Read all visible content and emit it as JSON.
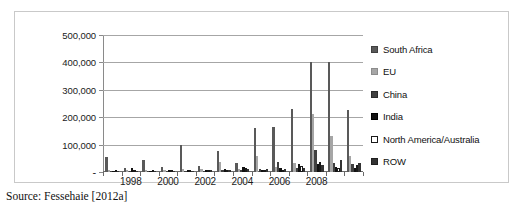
{
  "source_note": "Source: Fessehaie [2012a]",
  "legend": {
    "position": "right",
    "items": [
      {
        "label": "South Africa",
        "color": "#595959",
        "border": "#404040",
        "swatch": "filled-square"
      },
      {
        "label": "EU",
        "color": "#a6a6a6",
        "border": "#8c8c8c",
        "swatch": "filled-square"
      },
      {
        "label": "China",
        "color": "#404040",
        "border": "#2b2b2b",
        "swatch": "filled-square"
      },
      {
        "label": "India",
        "color": "#111111",
        "border": "#000000",
        "swatch": "filled-square"
      },
      {
        "label": "North America/Australia",
        "color": "#ffffff",
        "border": "#1a1a1a",
        "swatch": "hollow-square"
      },
      {
        "label": "ROW",
        "color": "#333333",
        "border": "#1f1f1f",
        "swatch": "filled-square"
      }
    ]
  },
  "chart_data": {
    "type": "bar",
    "title": "",
    "xlabel": "",
    "ylabel": "",
    "grid": true,
    "legend_position": "right",
    "ylim": [
      0,
      500000
    ],
    "yticks": [
      0,
      100000,
      200000,
      300000,
      400000,
      500000
    ],
    "ytick_labels": [
      "-",
      "100,000",
      "200,000",
      "300,000",
      "400,000",
      "500,000"
    ],
    "categories": [
      "1997",
      "1998",
      "1999",
      "2000",
      "2001",
      "2002",
      "2003",
      "2004",
      "2005",
      "2006",
      "2007",
      "2008",
      "2009",
      "2010"
    ],
    "xtick_labels_shown": [
      "1998",
      "2000",
      "2002",
      "2004",
      "2006",
      "2008"
    ],
    "series": [
      {
        "name": "South Africa",
        "color": "#595959",
        "values": [
          55000,
          13000,
          45000,
          18000,
          100000,
          23000,
          78000,
          32000,
          160000,
          163000,
          230000,
          400000,
          400000,
          228000
        ]
      },
      {
        "name": "EU",
        "color": "#a6a6a6",
        "values": [
          6000,
          8000,
          7000,
          9000,
          10000,
          12000,
          37000,
          12000,
          60000,
          18000,
          33000,
          210000,
          130000,
          60000
        ]
      },
      {
        "name": "China",
        "color": "#404040",
        "values": [
          3000,
          4000,
          3000,
          4000,
          5000,
          5000,
          7000,
          8000,
          12000,
          36000,
          16000,
          80000,
          33000,
          30000
        ]
      },
      {
        "name": "India",
        "color": "#111111",
        "values": [
          4000,
          15000,
          5000,
          8000,
          6000,
          9000,
          10000,
          20000,
          9000,
          15000,
          30000,
          30000,
          20000,
          14000
        ]
      },
      {
        "name": "North America/Australia",
        "color": "#ffffff",
        "values": [
          2000,
          3000,
          3000,
          3000,
          4000,
          5000,
          6000,
          15000,
          7000,
          9000,
          22000,
          37000,
          14000,
          24000
        ]
      },
      {
        "name": "ROW",
        "color": "#333333",
        "values": [
          3000,
          5000,
          4000,
          5000,
          5000,
          6000,
          9000,
          10000,
          10000,
          12000,
          14000,
          24000,
          45000,
          33000
        ]
      }
    ]
  }
}
